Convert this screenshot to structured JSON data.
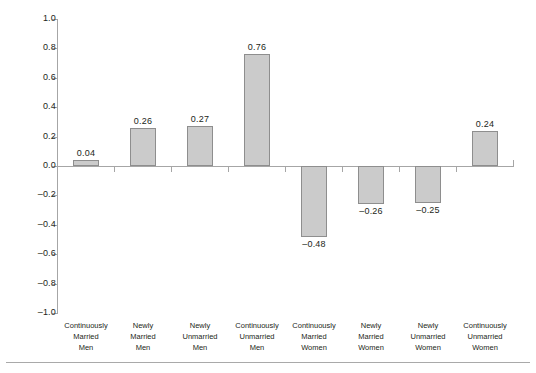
{
  "chart_data": {
    "type": "bar",
    "title": "",
    "subtitle": "",
    "xlabel": "",
    "ylabel": "",
    "ylim": [
      -1.0,
      1.0
    ],
    "grid": false,
    "legend": null,
    "orientation": "vertical",
    "bar_color": "#cbcbcb",
    "bar_border_color": "#8e8e8e",
    "axis_color": "#a6a6a6",
    "text_color": "#231f20",
    "y_ticks": [
      {
        "value": 1.0,
        "label": "1.0"
      },
      {
        "value": 0.8,
        "label": "0.8"
      },
      {
        "value": 0.6,
        "label": "0.6"
      },
      {
        "value": 0.4,
        "label": "0.4"
      },
      {
        "value": 0.2,
        "label": "0.2"
      },
      {
        "value": 0.0,
        "label": "0.0"
      },
      {
        "value": -0.2,
        "label": "–0.2"
      },
      {
        "value": -0.4,
        "label": "–0.4"
      },
      {
        "value": -0.6,
        "label": "–0.6"
      },
      {
        "value": -0.8,
        "label": "–0.8"
      },
      {
        "value": -1.0,
        "label": "–1.0"
      }
    ],
    "categories": [
      "Continuously Married Men",
      "Newly Married Men",
      "Newly Unmarried Men",
      "Continuously Unmarried Men",
      "Continuously Married Women",
      "Newly Married Women",
      "Newly Unmarried Women",
      "Continuously Unmarried Women"
    ],
    "category_lines": [
      [
        "Continuously",
        "Married",
        "Men"
      ],
      [
        "Newly",
        "Married",
        "Men"
      ],
      [
        "Newly",
        "Unmarried",
        "Men"
      ],
      [
        "Continuously",
        "Unmarried",
        "Men"
      ],
      [
        "Continuously",
        "Married",
        "Women"
      ],
      [
        "Newly",
        "Married",
        "Women"
      ],
      [
        "Newly",
        "Unmarried",
        "Women"
      ],
      [
        "Continuously",
        "Unmarried",
        "Women"
      ]
    ],
    "values": [
      0.04,
      0.26,
      0.27,
      0.76,
      -0.48,
      -0.26,
      -0.25,
      0.24
    ],
    "value_labels": [
      "0.04",
      "0.26",
      "0.27",
      "0.76",
      "–0.48",
      "–0.26",
      "–0.25",
      "0.24"
    ]
  }
}
